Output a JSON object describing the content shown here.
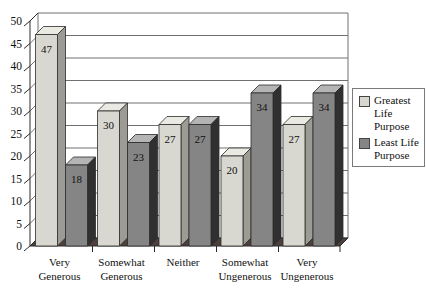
{
  "chart_data": {
    "type": "bar",
    "style": "3d-column",
    "title": "",
    "xlabel": "",
    "ylabel": "",
    "categories": [
      "Very Generous",
      "Somewhat Generous",
      "Neither",
      "Somewhat Ungenerous",
      "Very Ungenerous"
    ],
    "category_label_lines": [
      [
        "Very",
        "Generous"
      ],
      [
        "Somewhat",
        "Generous"
      ],
      [
        "Neither"
      ],
      [
        "Somewhat",
        "Ungenerous"
      ],
      [
        "Very",
        "Ungenerous"
      ]
    ],
    "series": [
      {
        "name": "Greatest Life Purpose",
        "values": [
          47,
          30,
          27,
          20,
          27
        ],
        "color_front": "#d8d8d0",
        "color_top": "#eaeae2",
        "color_side": "#9c9c94"
      },
      {
        "name": "Least Life Purpose",
        "values": [
          18,
          23,
          27,
          34,
          34
        ],
        "color_front": "#858585",
        "color_top": "#b4b4b4",
        "color_side": "#303030"
      }
    ],
    "value_labels_shown": true,
    "ylim": [
      0,
      50
    ],
    "ytick_step": 5,
    "yticks": [
      0,
      5,
      10,
      15,
      20,
      25,
      30,
      35,
      40,
      45,
      50
    ],
    "grid": true,
    "legend_position": "right",
    "colors": {
      "background": "#ffffff",
      "wall": "#ffffff",
      "floor": "#4d3f3b",
      "gridline": "#707070",
      "axis": "#2b2b2b",
      "text": "#111111"
    }
  }
}
